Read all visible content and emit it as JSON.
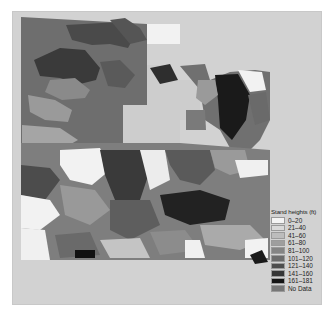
{
  "map": {
    "background_color": "#d2d2d2",
    "legend": {
      "title": "Stand heights (ft)",
      "items": [
        {
          "label": "0–20",
          "color": "#f4f4f4"
        },
        {
          "label": "21–40",
          "color": "#d9d9d9"
        },
        {
          "label": "41–60",
          "color": "#bcbcbc"
        },
        {
          "label": "61–80",
          "color": "#9e9e9e"
        },
        {
          "label": "81–100",
          "color": "#848484"
        },
        {
          "label": "101–120",
          "color": "#6c6c6c"
        },
        {
          "label": "121–140",
          "color": "#4e4e4e"
        },
        {
          "label": "141–160",
          "color": "#353535"
        },
        {
          "label": "161–181",
          "color": "#141414"
        },
        {
          "label": "No Data",
          "color": "#777777"
        }
      ]
    }
  }
}
